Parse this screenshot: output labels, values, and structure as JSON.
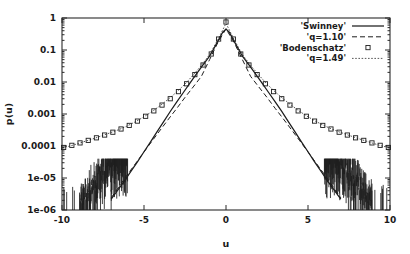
{
  "chart_data": {
    "type": "line",
    "title": "",
    "xlabel": "u",
    "ylabel": "p(u)",
    "xlim": [
      -10,
      10
    ],
    "ylim": [
      1e-06,
      1
    ],
    "yscale": "log",
    "xscale": "linear",
    "grid": false,
    "legend_position": "top-right",
    "xticks": [
      -10,
      -5,
      0,
      5,
      10
    ],
    "xtick_labels": [
      "-10",
      "-5",
      "0",
      "5",
      "10"
    ],
    "yticks": [
      1,
      0.1,
      0.01,
      0.001,
      0.0001,
      1e-05,
      1e-06
    ],
    "ytick_labels": [
      "1",
      "0.1",
      "0.01",
      "0.001",
      "0.0001",
      "1e-05",
      "1e-06"
    ],
    "series": [
      {
        "name": "'Swinney'",
        "style": "solid",
        "marker": "none",
        "x": [
          -7.0,
          -6.6,
          -6.2,
          -5.8,
          -5.4,
          -5.0,
          -4.6,
          -4.2,
          -3.8,
          -3.4,
          -3.0,
          -2.6,
          -2.2,
          -1.8,
          -1.4,
          -1.0,
          -0.6,
          -0.2,
          0.0,
          0.2,
          0.6,
          1.0,
          1.4,
          1.8,
          2.2,
          2.6,
          3.0,
          3.4,
          3.8,
          4.2,
          4.6,
          5.0,
          5.4,
          5.8,
          6.2,
          6.6,
          7.0
        ],
        "y": [
          2.2e-06,
          4.2e-06,
          8e-06,
          1.6e-05,
          3.2e-05,
          6.6e-05,
          0.000135,
          0.00028,
          0.00058,
          0.0012,
          0.0024,
          0.0047,
          0.0092,
          0.018,
          0.034,
          0.064,
          0.15,
          0.36,
          0.45,
          0.36,
          0.15,
          0.064,
          0.034,
          0.018,
          0.0092,
          0.0047,
          0.0024,
          0.0012,
          0.00058,
          0.00028,
          0.000135,
          6.6e-05,
          3.2e-05,
          1.6e-05,
          8e-06,
          4.2e-06,
          2.2e-06
        ]
      },
      {
        "name": "'q=1.10'",
        "style": "dashed",
        "marker": "none",
        "x": [
          -7.0,
          -6.5,
          -6.0,
          -5.5,
          -5.0,
          -4.5,
          -4.0,
          -3.5,
          -3.0,
          -2.5,
          -2.0,
          -1.5,
          -1.0,
          -0.5,
          0.0,
          0.5,
          1.0,
          1.5,
          2.0,
          2.5,
          3.0,
          3.5,
          4.0,
          4.5,
          5.0,
          5.5,
          6.0,
          6.5,
          7.0
        ],
        "y": [
          2.4e-06,
          5.6e-06,
          1.3e-05,
          2.9e-05,
          6.5e-05,
          0.000145,
          0.00032,
          0.0007,
          0.0015,
          0.0033,
          0.007,
          0.015,
          0.05,
          0.17,
          0.46,
          0.17,
          0.05,
          0.015,
          0.007,
          0.0033,
          0.0015,
          0.0007,
          0.00032,
          0.000145,
          6.5e-05,
          2.9e-05,
          1.3e-05,
          5.6e-06,
          2.4e-06
        ]
      },
      {
        "name": "'Bodenschatz'",
        "style": "none",
        "marker": "open-square",
        "x": [
          -9.9,
          -9.4,
          -8.9,
          -8.4,
          -7.9,
          -7.4,
          -6.9,
          -6.4,
          -5.9,
          -5.4,
          -4.9,
          -4.4,
          -3.9,
          -3.4,
          -2.9,
          -2.4,
          -1.9,
          -1.4,
          -0.9,
          -0.45,
          0.0,
          0.45,
          0.9,
          1.4,
          1.9,
          2.4,
          2.9,
          3.4,
          3.9,
          4.4,
          4.9,
          5.4,
          5.9,
          6.4,
          6.9,
          7.4,
          7.9,
          8.4,
          8.9,
          9.4,
          9.9
        ],
        "y": [
          9e-05,
          0.000105,
          0.000125,
          0.00015,
          0.00018,
          0.00022,
          0.00027,
          0.00034,
          0.00044,
          0.0006,
          0.00085,
          0.00125,
          0.0019,
          0.003,
          0.005,
          0.0088,
          0.017,
          0.034,
          0.075,
          0.22,
          0.75,
          0.22,
          0.075,
          0.034,
          0.017,
          0.0088,
          0.005,
          0.003,
          0.0019,
          0.00125,
          0.00085,
          0.0006,
          0.00044,
          0.00034,
          0.00027,
          0.00022,
          0.00018,
          0.00015,
          0.000125,
          0.000105,
          9e-05
        ]
      },
      {
        "name": "'q=1.49'",
        "style": "dotted",
        "marker": "none",
        "x": [
          -10.0,
          -9.5,
          -9.0,
          -8.5,
          -8.0,
          -7.5,
          -7.0,
          -6.5,
          -6.0,
          -5.5,
          -5.0,
          -4.5,
          -4.0,
          -3.5,
          -3.0,
          -2.5,
          -2.0,
          -1.5,
          -1.0,
          -0.5,
          0.0,
          0.5,
          1.0,
          1.5,
          2.0,
          2.5,
          3.0,
          3.5,
          4.0,
          4.5,
          5.0,
          5.5,
          6.0,
          6.5,
          7.0,
          7.5,
          8.0,
          8.5,
          9.0,
          9.5,
          10.0
        ],
        "y": [
          8.8e-05,
          0.0001,
          0.00012,
          0.000145,
          0.000175,
          0.000215,
          0.000265,
          0.00033,
          0.00043,
          0.00058,
          0.00082,
          0.0012,
          0.00185,
          0.00295,
          0.0049,
          0.0086,
          0.0165,
          0.033,
          0.072,
          0.21,
          0.68,
          0.21,
          0.072,
          0.033,
          0.0165,
          0.0086,
          0.0049,
          0.00295,
          0.00185,
          0.0012,
          0.00082,
          0.00058,
          0.00043,
          0.00033,
          0.000265,
          0.000215,
          0.000175,
          0.000145,
          0.00012,
          0.0001,
          8.8e-05
        ]
      }
    ],
    "noise_tail_note": "Swinney data shows noisy vertical spikes between 1e-6 and 1e-5 for |u| > 6"
  },
  "legend": {
    "entries": [
      {
        "label": "'Swinney'",
        "swatch": "solid-line"
      },
      {
        "label": "'q=1.10'",
        "swatch": "dashed-line"
      },
      {
        "label": "'Bodenschatz'",
        "swatch": "open-square"
      },
      {
        "label": "'q=1.49'",
        "swatch": "dotted-line"
      }
    ]
  },
  "axes": {
    "x_title": "u",
    "y_title": "p(u)",
    "x_tick_labels": [
      "-10",
      "-5",
      "0",
      "5",
      "10"
    ],
    "y_tick_labels": [
      "1",
      "0.1",
      "0.01",
      "0.001",
      "0.0001",
      "1e-05",
      "1e-06"
    ]
  },
  "colors": {
    "background": "#ffffff",
    "axis": "#2a2a2a",
    "ink": "#1d1d1d"
  }
}
